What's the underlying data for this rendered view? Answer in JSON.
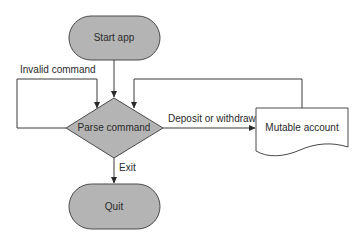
{
  "diagram": {
    "type": "flowchart",
    "nodes": {
      "start": {
        "label": "Start app",
        "shape": "terminator"
      },
      "parse": {
        "label": "Parse command",
        "shape": "decision"
      },
      "quit": {
        "label": "Quit",
        "shape": "terminator"
      },
      "account": {
        "label": "Mutable account",
        "shape": "document"
      }
    },
    "edges": {
      "start_to_parse": {
        "from": "start",
        "to": "parse",
        "label": ""
      },
      "invalid": {
        "from": "parse",
        "to": "parse",
        "label": "Invalid command"
      },
      "deposit": {
        "from": "parse",
        "to": "account",
        "label": "Deposit or withdraw"
      },
      "account_to_parse": {
        "from": "account",
        "to": "parse",
        "label": ""
      },
      "exit": {
        "from": "parse",
        "to": "quit",
        "label": "Exit"
      }
    },
    "colors": {
      "node_fill": "#b4b4b4",
      "node_stroke": "#4a4a4a",
      "document_fill": "#ffffff",
      "line": "#3a3a3a"
    }
  }
}
